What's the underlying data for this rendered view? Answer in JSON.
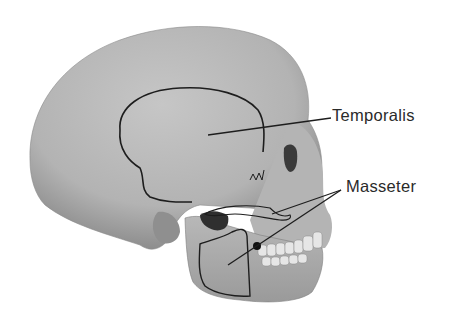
{
  "figure": {
    "background": "#ffffff",
    "bone_color": "#b9b9b9",
    "outline_color": "#222222"
  },
  "labels": {
    "temporalis": "Temporalis",
    "masseter": "Masseter"
  },
  "regions": [
    {
      "name": "temporalis",
      "label_ref": "labels.temporalis"
    },
    {
      "name": "masseter-superficial",
      "label_ref": "labels.masseter"
    },
    {
      "name": "masseter-deep",
      "label_ref": "labels.masseter"
    }
  ]
}
